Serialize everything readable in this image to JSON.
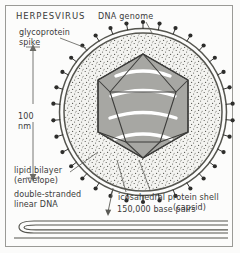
{
  "figure": {
    "title": "HERPESVIRUS",
    "background_color": "#fbfbfa",
    "frame_color": "#9a9a96",
    "ink_color": "#3a3a3a"
  },
  "labels": {
    "title": "HERPESVIRUS",
    "dna_genome": "DNA genome",
    "glycoprotein_spike": "glycoprotein\nspike",
    "scale": "100\nnm",
    "lipid_bilayer": "lipid bilayer\n(envelope)",
    "double_stranded_dna": "double-stranded\nlinear DNA",
    "icosahedral_shell": "icosahedral protein shell",
    "capsid": "(capsid)",
    "base_pairs": "150,000 base pairs"
  },
  "scale_bar": {
    "value": "100",
    "unit": "nm",
    "orientation": "vertical",
    "arrow_heads": "both"
  },
  "structure": {
    "envelope": {
      "name": "lipid bilayer envelope",
      "shape": "double-circle",
      "center_x": 143,
      "center_y": 112,
      "outer_radius": 84,
      "inner_radius": 79,
      "color": "#555550"
    },
    "spikes": {
      "name": "glycoprotein spikes",
      "count": 34,
      "stem_length": 7,
      "head_radius": 2.1,
      "color": "#2d2d2b"
    },
    "tegument": {
      "name": "stippled tegument matrix",
      "radius": 78,
      "fill": "#f2f2ef",
      "stipple_color": "#4a4a46"
    },
    "capsid": {
      "name": "icosahedral protein shell (capsid)",
      "shape": "icosahedron",
      "center_x": 143,
      "center_y": 106,
      "radius": 52,
      "face_fill": "#a9a9a5",
      "edge_color": "#3c3c3a"
    },
    "dna_coils": {
      "name": "packaged DNA coils",
      "band_count": 4,
      "color": "#ffffff"
    },
    "linear_dna": {
      "name": "double-stranded linear DNA",
      "shape": "folded-hairpin",
      "strand_color": "#4a4a46",
      "length_label": "150,000 base pairs"
    }
  },
  "leaders": [
    {
      "name": "leader-dna-genome",
      "from": "DNA genome label",
      "to": "envelope top"
    },
    {
      "name": "leader-glycoprotein-spike",
      "from": "glycoprotein spike label",
      "to": "spike head"
    },
    {
      "name": "leader-lipid-bilayer",
      "from": "lipid bilayer label",
      "to": "envelope lower-left"
    },
    {
      "name": "leader-icosahedral-shell",
      "from": "icosahedral protein shell label",
      "to": "capsid lower edge"
    },
    {
      "name": "leader-base-pairs",
      "from": "150,000 base pairs label",
      "to": "linear DNA strand"
    }
  ]
}
